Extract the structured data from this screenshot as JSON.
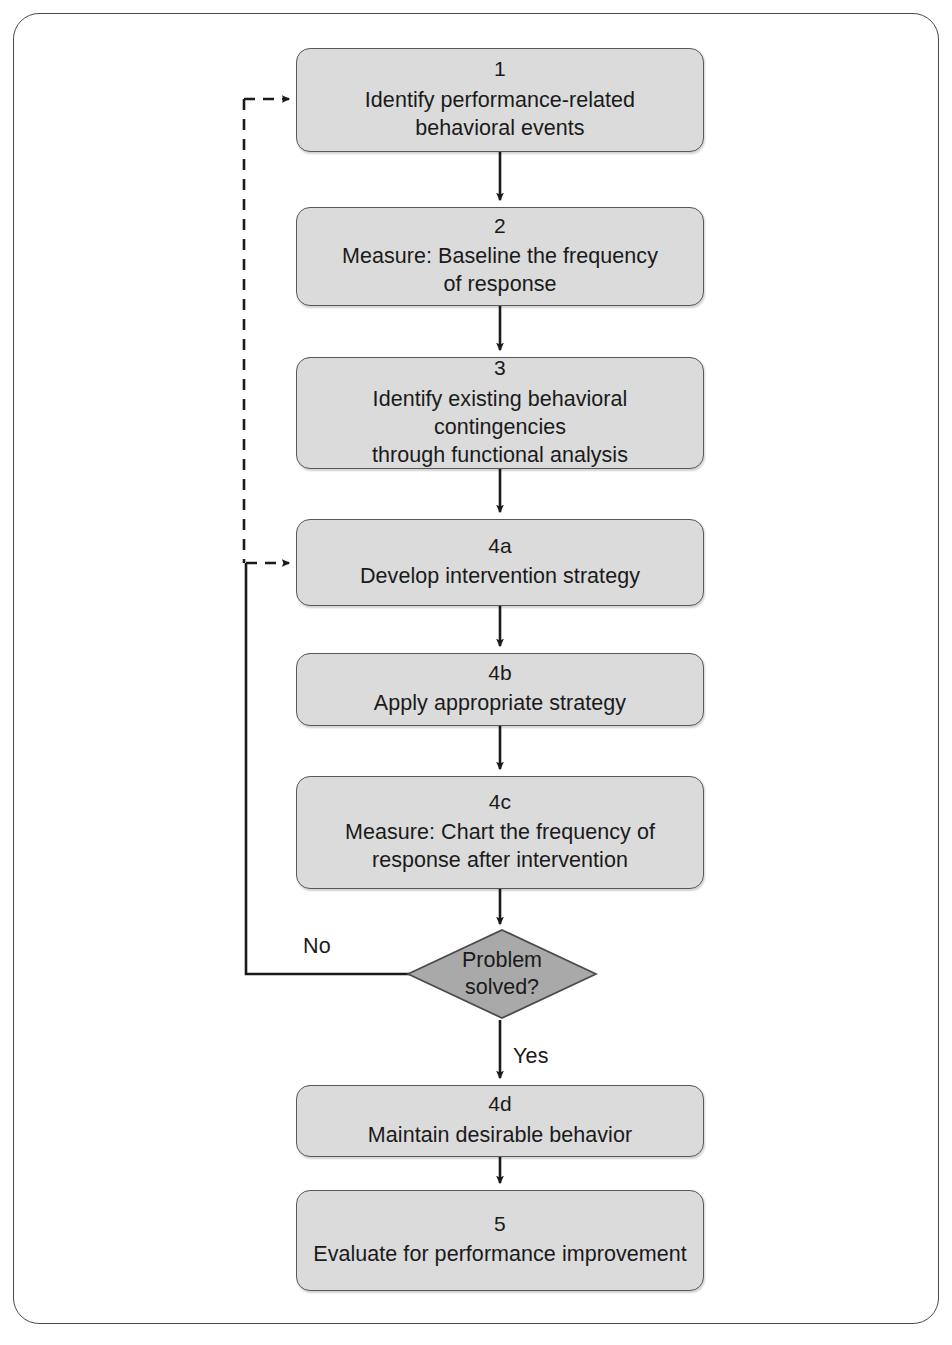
{
  "diagram": {
    "colors": {
      "node_fill": "#dbdbdb",
      "node_border": "#595959",
      "decision_fill": "#a9a9a9",
      "decision_border": "#4a4a4a",
      "line": "#1a1a1a",
      "frame": "#4a4a4a",
      "background": "#ffffff"
    },
    "nodes": [
      {
        "id": "1",
        "number": "1",
        "text": "Identify performance-related\nbehavioral events",
        "shape": "rounded-rect"
      },
      {
        "id": "2",
        "number": "2",
        "text": "Measure: Baseline the frequency\nof response",
        "shape": "rounded-rect"
      },
      {
        "id": "3",
        "number": "3",
        "text": "Identify existing behavioral contingencies\nthrough functional analysis",
        "shape": "rounded-rect"
      },
      {
        "id": "4a",
        "number": "4a",
        "text": "Develop intervention strategy",
        "shape": "rounded-rect"
      },
      {
        "id": "4b",
        "number": "4b",
        "text": "Apply appropriate strategy",
        "shape": "rounded-rect"
      },
      {
        "id": "4c",
        "number": "4c",
        "text": "Measure: Chart the frequency of\nresponse after intervention",
        "shape": "rounded-rect"
      },
      {
        "id": "4d",
        "number": "4d",
        "text": "Maintain desirable behavior",
        "shape": "rounded-rect"
      },
      {
        "id": "5",
        "number": "5",
        "text": "Evaluate for performance improvement",
        "shape": "rounded-rect"
      }
    ],
    "decision": {
      "id": "problem-solved",
      "text": "Problem\nsolved?",
      "shape": "diamond",
      "branches": [
        {
          "label": "No",
          "target": "4a",
          "style": "solid"
        },
        {
          "label": "Yes",
          "target": "4d",
          "style": "solid"
        }
      ]
    },
    "edges": [
      {
        "from": "1",
        "to": "2",
        "style": "solid",
        "label": ""
      },
      {
        "from": "2",
        "to": "3",
        "style": "solid",
        "label": ""
      },
      {
        "from": "3",
        "to": "4a",
        "style": "solid",
        "label": ""
      },
      {
        "from": "4a",
        "to": "4b",
        "style": "solid",
        "label": ""
      },
      {
        "from": "4b",
        "to": "4c",
        "style": "solid",
        "label": ""
      },
      {
        "from": "4c",
        "to": "problem-solved",
        "style": "solid",
        "label": ""
      },
      {
        "from": "problem-solved",
        "to": "4a",
        "style": "solid",
        "label": "No"
      },
      {
        "from": "problem-solved",
        "to": "4d",
        "style": "solid",
        "label": "Yes"
      },
      {
        "from": "4d",
        "to": "5",
        "style": "solid",
        "label": ""
      },
      {
        "from": "feedback-loop",
        "to": "1",
        "style": "dashed",
        "label": ""
      },
      {
        "from": "feedback-loop",
        "to": "4a",
        "style": "dashed",
        "label": ""
      }
    ],
    "edge_labels": {
      "no": "No",
      "yes": "Yes"
    }
  }
}
